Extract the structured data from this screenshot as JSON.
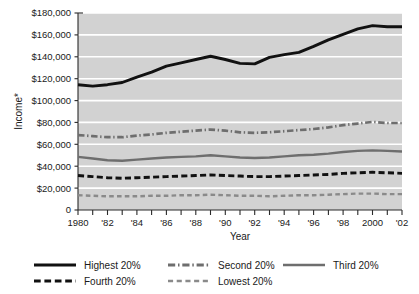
{
  "chart_data": {
    "type": "line",
    "title": "",
    "xlabel": "Year",
    "ylabel": "Income*",
    "xlim": [
      1980,
      2002
    ],
    "ylim": [
      0,
      180000
    ],
    "grid": true,
    "grid_axis": "y",
    "legend_position": "below",
    "plot_background": "#d2d2d2",
    "gridline_color": "#ffffff",
    "x": [
      1980,
      1981,
      1982,
      1983,
      1984,
      1985,
      1986,
      1987,
      1988,
      1989,
      1990,
      1991,
      1992,
      1993,
      1994,
      1995,
      1996,
      1997,
      1998,
      1999,
      2000,
      2001,
      2002
    ],
    "xtick_labels": [
      "1980",
      "",
      "'82",
      "",
      "'84",
      "",
      "'86",
      "",
      "'88",
      "",
      "'90",
      "",
      "'92",
      "",
      "'94",
      "",
      "'96",
      "",
      "'98",
      "",
      "2000",
      "",
      "'02"
    ],
    "ytick_labels": [
      "$180,000",
      "$160,000",
      "$140,000",
      "$120,000",
      "$100,000",
      "$80,000",
      "$60,000",
      "$40,000",
      "$20,000",
      "0"
    ],
    "ytick_values": [
      180000,
      160000,
      140000,
      120000,
      100000,
      80000,
      60000,
      40000,
      20000,
      0
    ],
    "series": [
      {
        "name": "Highest 20%",
        "color": "#111111",
        "width": 2.9,
        "dash": "none",
        "values": [
          114500,
          113200,
          114500,
          116500,
          121500,
          126000,
          131500,
          134500,
          137500,
          140500,
          137500,
          134000,
          133500,
          139500,
          142000,
          144000,
          149500,
          155500,
          160500,
          165500,
          168500,
          167500,
          167500
        ]
      },
      {
        "name": "Second 20%",
        "color": "#6e6e6e",
        "width": 2.7,
        "dash": "dashdot",
        "values": [
          68500,
          67500,
          66500,
          66500,
          68000,
          69000,
          70500,
          71500,
          72500,
          73500,
          72500,
          71000,
          70500,
          71000,
          72000,
          73000,
          74000,
          75500,
          77500,
          79000,
          80500,
          79500,
          79500
        ]
      },
      {
        "name": "Third 20%",
        "color": "#6e6e6e",
        "width": 2.4,
        "dash": "none",
        "values": [
          48500,
          47000,
          45500,
          45000,
          46000,
          47000,
          48000,
          48500,
          49000,
          50000,
          49000,
          48000,
          47500,
          48000,
          49000,
          50000,
          50500,
          51500,
          53000,
          54000,
          54500,
          54000,
          53500
        ]
      },
      {
        "name": "Fourth 20%",
        "color": "#111111",
        "width": 2.9,
        "dash": "dashed",
        "values": [
          31500,
          30500,
          29500,
          29000,
          29500,
          30000,
          30500,
          31000,
          31500,
          32000,
          31500,
          31000,
          30500,
          30500,
          31000,
          31500,
          32000,
          32500,
          33500,
          34000,
          34500,
          34000,
          33500
        ]
      },
      {
        "name": "Lowest 20%",
        "color": "#8a8a8a",
        "width": 2.4,
        "dash": "smalldash",
        "values": [
          13500,
          13000,
          12500,
          12500,
          12500,
          13000,
          13000,
          13500,
          13500,
          14000,
          13500,
          13000,
          13000,
          12500,
          13000,
          13500,
          13500,
          14000,
          14500,
          15000,
          15000,
          14500,
          14500
        ]
      }
    ],
    "legend": [
      {
        "label": "Highest 20%",
        "color": "#111111",
        "dash": "none"
      },
      {
        "label": "Second 20%",
        "color": "#6e6e6e",
        "dash": "dashdot"
      },
      {
        "label": "Third 20%",
        "color": "#6e6e6e",
        "dash": "none"
      },
      {
        "label": "Fourth 20%",
        "color": "#111111",
        "dash": "dashed"
      },
      {
        "label": "Lowest 20%",
        "color": "#8a8a8a",
        "dash": "smalldash"
      }
    ]
  }
}
